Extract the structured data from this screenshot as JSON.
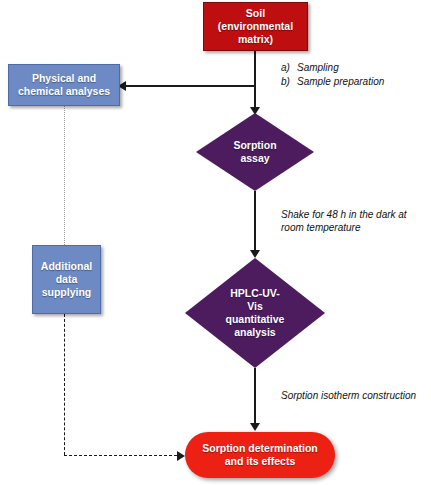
{
  "diagram": {
    "colors": {
      "soil_red": "#BE0E10",
      "result_red": "#EC2013",
      "box_blue": "#6D8AC4",
      "diamond_purple": "#4C1C5E",
      "connector": "#1a1a1a",
      "dotted_connector": "#9a9a9a",
      "node_text": "#ffffff",
      "annotation_text": "#111111",
      "background": "#ffffff"
    },
    "nodes": {
      "soil": {
        "label": "Soil\n(environmental\nmatrix)",
        "shape": "rectangle"
      },
      "physical_chemical": {
        "label": "Physical and\nchemical analyses",
        "shape": "rectangle"
      },
      "additional_data": {
        "label": "Additional\ndata\nsupplying",
        "shape": "rectangle"
      },
      "sorption_assay": {
        "label": "Sorption\nassay",
        "shape": "diamond"
      },
      "hplc": {
        "label": "HPLC-UV-\nVis\nquantitative\nanalysis",
        "shape": "diamond"
      },
      "result": {
        "label": "Sorption determination\nand its effects",
        "shape": "stadium"
      }
    },
    "annotations": {
      "sampling_steps": [
        {
          "marker": "a)",
          "text": "Sampling"
        },
        {
          "marker": "b)",
          "text": "Sample preparation"
        }
      ],
      "shake": "Shake for 48 h in the dark at room temperature",
      "isotherm": "Sorption isotherm construction"
    }
  }
}
